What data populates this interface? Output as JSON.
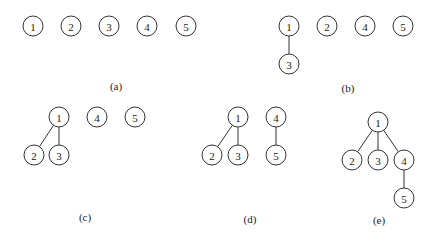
{
  "diagram": {
    "radius": 10,
    "panels": [
      {
        "id": "a",
        "caption": "(a)",
        "caption_pos": [
          116,
          90
        ],
        "nodes": [
          {
            "label": "1",
            "x": 33,
            "y": 26
          },
          {
            "label": "2",
            "x": 71,
            "y": 26
          },
          {
            "label": "3",
            "x": 109,
            "y": 26
          },
          {
            "label": "4",
            "x": 147,
            "y": 26
          },
          {
            "label": "5",
            "x": 186,
            "y": 26
          }
        ],
        "edges": []
      },
      {
        "id": "b",
        "caption": "(b)",
        "caption_pos": [
          348,
          92
        ],
        "nodes": [
          {
            "label": "1",
            "x": 289,
            "y": 26
          },
          {
            "label": "3",
            "x": 289,
            "y": 64
          },
          {
            "label": "2",
            "x": 327,
            "y": 26
          },
          {
            "label": "4",
            "x": 365,
            "y": 26
          },
          {
            "label": "5",
            "x": 403,
            "y": 26
          }
        ],
        "edges": [
          [
            "1",
            "3"
          ]
        ]
      },
      {
        "id": "c",
        "caption": "(c)",
        "caption_pos": [
          85,
          221
        ],
        "nodes": [
          {
            "label": "1",
            "x": 59,
            "y": 117
          },
          {
            "label": "2",
            "x": 34,
            "y": 155
          },
          {
            "label": "3",
            "x": 59,
            "y": 155
          },
          {
            "label": "4",
            "x": 97,
            "y": 117
          },
          {
            "label": "5",
            "x": 135,
            "y": 117
          }
        ],
        "edges": [
          [
            "1",
            "2"
          ],
          [
            "1",
            "3"
          ]
        ]
      },
      {
        "id": "d",
        "caption": "(d)",
        "caption_pos": [
          250,
          223
        ],
        "nodes": [
          {
            "label": "1",
            "x": 238,
            "y": 117
          },
          {
            "label": "2",
            "x": 212,
            "y": 155
          },
          {
            "label": "3",
            "x": 238,
            "y": 155
          },
          {
            "label": "4",
            "x": 276,
            "y": 117
          },
          {
            "label": "5",
            "x": 276,
            "y": 155
          }
        ],
        "edges": [
          [
            "1",
            "2"
          ],
          [
            "1",
            "3"
          ],
          [
            "4",
            "5"
          ]
        ]
      },
      {
        "id": "e",
        "caption": "(e)",
        "caption_pos": [
          379,
          224
        ],
        "nodes": [
          {
            "label": "1",
            "x": 378,
            "y": 122
          },
          {
            "label": "2",
            "x": 352,
            "y": 160
          },
          {
            "label": "3",
            "x": 378,
            "y": 160
          },
          {
            "label": "4",
            "x": 404,
            "y": 160
          },
          {
            "label": "5",
            "x": 404,
            "y": 198
          }
        ],
        "edges": [
          [
            "1",
            "2"
          ],
          [
            "1",
            "3"
          ],
          [
            "1",
            "4"
          ],
          [
            "4",
            "5"
          ]
        ]
      }
    ]
  }
}
